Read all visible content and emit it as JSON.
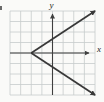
{
  "figure": {
    "background": "#fafaf8",
    "grid_color": "#c7cccc",
    "axis_color": "#3f3f3f",
    "curve_color": "#383838",
    "label_color": "#1c1c1c",
    "x_label": "x",
    "y_label": "y"
  },
  "chart_data": {
    "type": "line",
    "title": "",
    "xlabel": "x",
    "ylabel": "y",
    "xlim": [
      -4,
      4
    ],
    "ylim": [
      -4,
      4
    ],
    "grid": true,
    "legend": false,
    "series": [
      {
        "name": "upper-ray",
        "points": [
          [
            -2,
            0
          ],
          [
            4,
            4
          ]
        ],
        "arrow_end": true
      },
      {
        "name": "lower-ray",
        "points": [
          [
            -2,
            0
          ],
          [
            4,
            -4
          ]
        ],
        "arrow_end": true
      }
    ],
    "vertex": [
      -2,
      0
    ],
    "slopes": [
      0.667,
      -0.667
    ]
  }
}
